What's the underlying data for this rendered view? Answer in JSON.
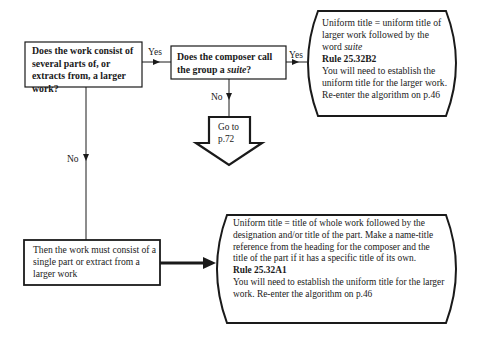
{
  "diagram": {
    "nodes": {
      "q1": {
        "type": "decision-box",
        "text": "Does the work consist of several parts of, or extracts from, a larger work?"
      },
      "q2": {
        "type": "decision-box",
        "text_before": "Does the composer call the group a ",
        "text_italic": "suite",
        "text_after": "?"
      },
      "result_suite": {
        "type": "outcome-box",
        "line1_before": "Uniform title = uniform title of larger work followed by the word ",
        "line1_italic": "suite",
        "rule": "Rule 25.32B2",
        "instruction": "You will need to establish the uniform title for the larger work. Re-enter the algorithm on p.46"
      },
      "goto": {
        "type": "goto-arrow",
        "line1": "Go to",
        "line2": "p.72"
      },
      "single_part": {
        "type": "statement-box",
        "text": "Then the work must consist of a single part or extract from a larger work"
      },
      "result_part": {
        "type": "outcome-box",
        "description": "Uniform title = title of whole work followed by the designation and/or title of the part. Make a name-title reference from the heading for the composer and the title of the part if it has a specific title of its own.",
        "rule": "Rule 25.32A1",
        "instruction": "You will need to establish the uniform title for the larger work. Re-enter the algorithm on p.46"
      }
    },
    "edges": [
      {
        "from": "q1",
        "to": "q2",
        "label": "Yes"
      },
      {
        "from": "q2",
        "to": "result_suite",
        "label": "Yes"
      },
      {
        "from": "q2",
        "to": "goto",
        "label": "No"
      },
      {
        "from": "q1",
        "to": "single_part",
        "label": "No"
      },
      {
        "from": "single_part",
        "to": "result_part",
        "label": ""
      }
    ],
    "colors": {
      "stroke": "#1a1a1a",
      "background": "#ffffff"
    }
  }
}
